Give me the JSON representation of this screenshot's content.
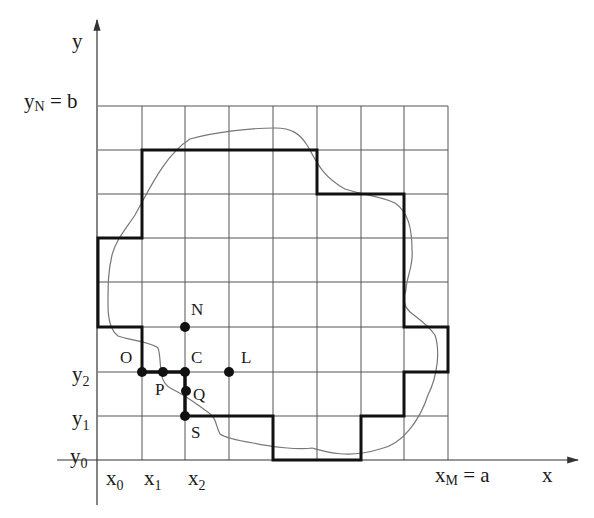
{
  "diagram": {
    "axes": {
      "x_label": "x",
      "y_label": "y",
      "x_ticks": [
        {
          "base": "x",
          "sub": "0"
        },
        {
          "base": "x",
          "sub": "1"
        },
        {
          "base": "x",
          "sub": "2"
        }
      ],
      "y_ticks": [
        {
          "base": "y",
          "sub": "0"
        },
        {
          "base": "y",
          "sub": "1"
        },
        {
          "base": "y",
          "sub": "2"
        }
      ],
      "x_end_label": {
        "base": "x",
        "sub": "M",
        "rest": " = a"
      },
      "y_end_label": {
        "base": "y",
        "sub": "N",
        "rest": " = b"
      }
    },
    "grid": {
      "columns": 8,
      "rows": 8
    },
    "points": [
      {
        "name": "N"
      },
      {
        "name": "O"
      },
      {
        "name": "P"
      },
      {
        "name": "C"
      },
      {
        "name": "L"
      },
      {
        "name": "Q"
      },
      {
        "name": "S"
      }
    ],
    "colors": {
      "grid": "#555555",
      "boundary": "#111111",
      "curve": "#777777",
      "points": "#111111"
    }
  }
}
